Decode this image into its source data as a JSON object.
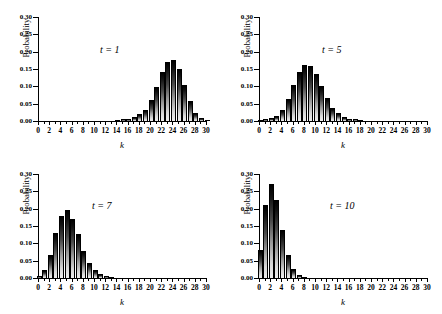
{
  "figure": {
    "layout": "2x2-grid",
    "panel_count": 4
  },
  "axes": {
    "ylabel": "Probability",
    "xlabel": "k",
    "yticks": [
      "0.00",
      "0.05",
      "0.10",
      "0.15",
      "0.20",
      "0.25",
      "0.30"
    ],
    "xticks": [
      "0",
      "2",
      "4",
      "6",
      "8",
      "10",
      "12",
      "14",
      "16",
      "18",
      "20",
      "22",
      "24",
      "26",
      "28",
      "30"
    ]
  },
  "chart_data": [
    {
      "type": "bar",
      "title": "t = 1",
      "xlabel": "k",
      "ylabel": "Probability",
      "xlim": [
        0,
        30
      ],
      "ylim": [
        0.0,
        0.3
      ],
      "grid": false,
      "legend": "none",
      "categories": [
        0,
        1,
        2,
        3,
        4,
        5,
        6,
        7,
        8,
        9,
        10,
        11,
        12,
        13,
        14,
        15,
        16,
        17,
        18,
        19,
        20,
        21,
        22,
        23,
        24,
        25,
        26,
        27,
        28,
        29,
        30
      ],
      "values": [
        0.0,
        0.0,
        0.0,
        0.0,
        0.0,
        0.0,
        0.0,
        0.0,
        0.0,
        0.0,
        0.0,
        0.0,
        0.0,
        0.0,
        0.001,
        0.002,
        0.004,
        0.009,
        0.017,
        0.03,
        0.057,
        0.094,
        0.138,
        0.166,
        0.172,
        0.148,
        0.1,
        0.055,
        0.021,
        0.005,
        0.001
      ]
    },
    {
      "type": "bar",
      "title": "t = 5",
      "xlabel": "k",
      "ylabel": "Probability",
      "xlim": [
        0,
        30
      ],
      "ylim": [
        0.0,
        0.3
      ],
      "grid": false,
      "legend": "none",
      "categories": [
        0,
        1,
        2,
        3,
        4,
        5,
        6,
        7,
        8,
        9,
        10,
        11,
        12,
        13,
        14,
        15,
        16,
        17,
        18,
        19,
        20,
        21,
        22,
        23,
        24,
        25,
        26,
        27,
        28,
        29,
        30
      ],
      "values": [
        0.001,
        0.002,
        0.005,
        0.013,
        0.03,
        0.06,
        0.101,
        0.138,
        0.159,
        0.157,
        0.132,
        0.097,
        0.063,
        0.036,
        0.019,
        0.009,
        0.004,
        0.002,
        0.001,
        0.0,
        0.0,
        0.0,
        0.0,
        0.0,
        0.0,
        0.0,
        0.0,
        0.0,
        0.0,
        0.0,
        0.0
      ]
    },
    {
      "type": "bar",
      "title": "t = 7",
      "xlabel": "k",
      "ylabel": "Probability",
      "xlim": [
        0,
        30
      ],
      "ylim": [
        0.0,
        0.3
      ],
      "grid": false,
      "legend": "none",
      "categories": [
        0,
        1,
        2,
        3,
        4,
        5,
        6,
        7,
        8,
        9,
        10,
        11,
        12,
        13,
        14,
        15,
        16,
        17,
        18,
        19,
        20,
        21,
        22,
        23,
        24,
        25,
        26,
        27,
        28,
        29,
        30
      ],
      "values": [
        0.003,
        0.021,
        0.063,
        0.126,
        0.176,
        0.192,
        0.168,
        0.123,
        0.075,
        0.041,
        0.019,
        0.008,
        0.003,
        0.001,
        0.0,
        0.0,
        0.0,
        0.0,
        0.0,
        0.0,
        0.0,
        0.0,
        0.0,
        0.0,
        0.0,
        0.0,
        0.0,
        0.0,
        0.0,
        0.0,
        0.0
      ]
    },
    {
      "type": "bar",
      "title": "t = 10",
      "xlabel": "k",
      "ylabel": "Probability",
      "xlim": [
        0,
        30
      ],
      "ylim": [
        0.0,
        0.3
      ],
      "grid": false,
      "legend": "none",
      "categories": [
        0,
        1,
        2,
        3,
        4,
        5,
        6,
        7,
        8,
        9,
        10,
        11,
        12,
        13,
        14,
        15,
        16,
        17,
        18,
        19,
        20,
        21,
        22,
        23,
        24,
        25,
        26,
        27,
        28,
        29,
        30
      ],
      "values": [
        0.079,
        0.207,
        0.267,
        0.223,
        0.136,
        0.064,
        0.022,
        0.006,
        0.001,
        0.0,
        0.0,
        0.0,
        0.0,
        0.0,
        0.0,
        0.0,
        0.0,
        0.0,
        0.0,
        0.0,
        0.0,
        0.0,
        0.0,
        0.0,
        0.0,
        0.0,
        0.0,
        0.0,
        0.0,
        0.0,
        0.0
      ]
    }
  ]
}
